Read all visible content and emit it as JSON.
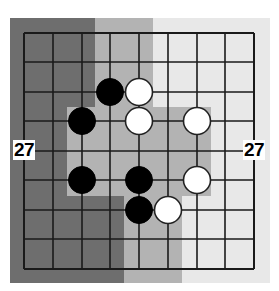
{
  "diagram": {
    "type": "go-board-fragment",
    "grid": {
      "columns": 9,
      "rows": 9
    },
    "colors": {
      "dark_region": "#6e6e6e",
      "mid_region": "#b3b3b3",
      "light_region": "#e8e8e8",
      "grid_line": "#1a1a1a",
      "black_stone": "#000000",
      "white_stone": "#ffffff"
    },
    "labels": {
      "left": "27",
      "right": "27"
    },
    "stones": [
      {
        "color": "black",
        "col": 3,
        "row": 2
      },
      {
        "color": "white",
        "col": 4,
        "row": 2
      },
      {
        "color": "black",
        "col": 2,
        "row": 3
      },
      {
        "color": "white",
        "col": 4,
        "row": 3
      },
      {
        "color": "white",
        "col": 6,
        "row": 3
      },
      {
        "color": "black",
        "col": 2,
        "row": 5
      },
      {
        "color": "black",
        "col": 4,
        "row": 5
      },
      {
        "color": "white",
        "col": 6,
        "row": 5
      },
      {
        "color": "black",
        "col": 4,
        "row": 6
      },
      {
        "color": "white",
        "col": 5,
        "row": 6
      }
    ],
    "territory_regions": [
      {
        "shade": "dark",
        "description": "left territory"
      },
      {
        "shade": "mid",
        "description": "central contested area"
      },
      {
        "shade": "light",
        "description": "right territory"
      }
    ]
  }
}
